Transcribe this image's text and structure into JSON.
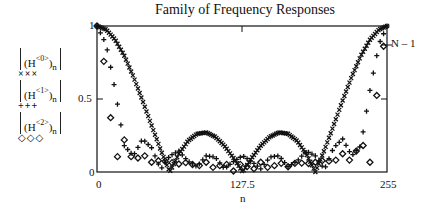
{
  "chart_data": {
    "type": "scatter",
    "title": "Family of Frequency Responses",
    "xlabel": "n",
    "ylabel": "",
    "xlim": [
      0,
      255
    ],
    "ylim": [
      0,
      1
    ],
    "x_ticks": [
      "0",
      "127.5",
      "255"
    ],
    "y_ticks": [
      "0",
      "0.5",
      "1"
    ],
    "annotation": "N – 1",
    "grid": false,
    "legend_position": "left",
    "x": [
      0,
      8,
      16,
      24,
      32,
      40,
      48,
      56,
      64,
      72,
      80,
      88,
      96,
      104,
      112,
      120,
      128,
      136,
      144,
      152,
      160,
      168,
      176,
      184,
      192,
      200,
      208,
      216,
      224,
      232,
      240,
      248,
      255
    ],
    "series": [
      {
        "name": "|(H<0>)n|",
        "marker": "x",
        "values": [
          1,
          0.976,
          0.906,
          0.796,
          0.653,
          0.49,
          0.318,
          0.151,
          0,
          0.124,
          0.213,
          0.262,
          0.271,
          0.241,
          0.18,
          0.096,
          0,
          0.096,
          0.18,
          0.241,
          0.271,
          0.262,
          0.213,
          0.124,
          0,
          0.151,
          0.318,
          0.49,
          0.653,
          0.796,
          0.906,
          0.976,
          1
        ]
      },
      {
        "name": "|(H<1>)n|",
        "marker": "+",
        "values": [
          1,
          0.876,
          0.559,
          0.18,
          0.111,
          0.226,
          0.166,
          0.017,
          0.111,
          0.143,
          0.074,
          0.037,
          0.111,
          0.102,
          0.022,
          0.071,
          0.111,
          0.071,
          0.022,
          0.102,
          0.111,
          0.037,
          0.074,
          0.143,
          0.111,
          0.017,
          0.166,
          0.226,
          0.111,
          0.18,
          0.559,
          0.876,
          1
        ]
      },
      {
        "name": "|(H<2>)n|",
        "marker": "diamond",
        "values": [
          1,
          0.677,
          0.067,
          0.22,
          0.067,
          0.125,
          0.067,
          0.081,
          0.067,
          0.055,
          0.067,
          0.036,
          0.067,
          0.02,
          0.067,
          0.007,
          0.067,
          0.007,
          0.067,
          0.02,
          0.067,
          0.036,
          0.067,
          0.055,
          0.067,
          0.081,
          0.067,
          0.125,
          0.067,
          0.22,
          0.067,
          0.677,
          1
        ]
      }
    ]
  },
  "legend": [
    {
      "base": "H",
      "sup": "<0>",
      "sub": "n",
      "marker": "×××"
    },
    {
      "base": "H",
      "sup": "<1>",
      "sub": "n",
      "marker": "+++"
    },
    {
      "base": "H",
      "sup": "<2>",
      "sub": "n",
      "marker": "◇◇◇"
    }
  ]
}
